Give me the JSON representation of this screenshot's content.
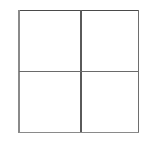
{
  "figure": {
    "name": "two-by-two-grid",
    "background_color": "#ffffff",
    "canvas": {
      "width": 149,
      "height": 144
    },
    "square": {
      "left": 18,
      "top": 10,
      "right": 139,
      "bottom": 133,
      "width": 121,
      "height": 123
    },
    "rows": 2,
    "columns": 2,
    "cell_count": 4,
    "lines": [
      {
        "name": "outer-top-edge",
        "orientation": "horizontal",
        "x1": 18,
        "y1": 10,
        "x2": 139,
        "y2": 10,
        "color": "#4a4a4a",
        "thickness": 1.6
      },
      {
        "name": "outer-right-edge",
        "orientation": "vertical",
        "x1": 138,
        "y1": 10,
        "x2": 138,
        "y2": 133,
        "color": "#6e6e6e",
        "thickness": 1.3
      },
      {
        "name": "outer-bottom-edge",
        "orientation": "horizontal",
        "x1": 18,
        "y1": 132,
        "x2": 139,
        "y2": 132,
        "color": "#8a8a8a",
        "thickness": 1.4
      },
      {
        "name": "outer-left-edge",
        "orientation": "vertical",
        "x1": 19,
        "y1": 10,
        "x2": 19,
        "y2": 133,
        "color": "#8a8a8a",
        "thickness": 1.5
      },
      {
        "name": "inner-vertical-divider",
        "orientation": "vertical",
        "x1": 81,
        "y1": 10,
        "x2": 81,
        "y2": 132,
        "color": "#5a5a5a",
        "thickness": 1.2
      },
      {
        "name": "inner-horizontal-divider",
        "orientation": "horizontal",
        "x1": 19,
        "y1": 71,
        "x2": 138,
        "y2": 71,
        "color": "#6a6a6a",
        "thickness": 1.3
      }
    ],
    "cells": [
      {
        "name": "cell-top-left",
        "row": 1,
        "column": 1,
        "label": "",
        "x": 19,
        "y": 10,
        "width": 62,
        "height": 61,
        "fill": "#ffffff"
      },
      {
        "name": "cell-top-right",
        "row": 1,
        "column": 2,
        "label": "",
        "x": 81,
        "y": 10,
        "width": 57,
        "height": 61,
        "fill": "#ffffff"
      },
      {
        "name": "cell-bottom-left",
        "row": 2,
        "column": 1,
        "label": "",
        "x": 19,
        "y": 71,
        "width": 62,
        "height": 61,
        "fill": "#ffffff"
      },
      {
        "name": "cell-bottom-right",
        "row": 2,
        "column": 2,
        "label": "",
        "x": 81,
        "y": 71,
        "width": 57,
        "height": 61,
        "fill": "#ffffff"
      }
    ]
  }
}
